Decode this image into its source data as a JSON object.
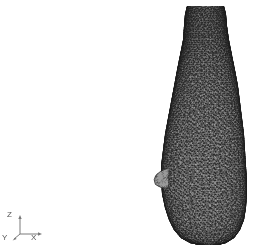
{
  "figure": {
    "background_color": "#ffffff",
    "mesh_color": "#3a3a3a",
    "mesh_fill_color": "#b9b9b9",
    "width": 259,
    "height": 251
  },
  "axis_triad": {
    "name": "coordinate-axis-triad",
    "origin_px": [
      20,
      234
    ],
    "line_color": "#7a7a7a",
    "label_color": "#555555",
    "axes": [
      {
        "id": "z",
        "label": "Z",
        "direction": "up",
        "end_px": [
          20,
          212
        ]
      },
      {
        "id": "x",
        "label": "X",
        "direction": "right",
        "end_px": [
          42,
          234
        ]
      },
      {
        "id": "y",
        "label": "Y",
        "direction": "out-of-screen",
        "end_px": [
          14,
          239
        ]
      }
    ]
  },
  "mesh_object": {
    "name": "bottle-mesh",
    "shape": "bottle",
    "element_type": "triangle",
    "rendering": "wireframe-surface",
    "bounds_px": {
      "left": 160,
      "top": 6,
      "right": 248,
      "bottom": 245
    },
    "profile": [
      {
        "y": 6,
        "left": 187,
        "right": 224
      },
      {
        "y": 14,
        "left": 185,
        "right": 226
      },
      {
        "y": 26,
        "left": 184,
        "right": 227
      },
      {
        "y": 40,
        "left": 183,
        "right": 229
      },
      {
        "y": 55,
        "left": 180,
        "right": 232
      },
      {
        "y": 70,
        "left": 177,
        "right": 235
      },
      {
        "y": 86,
        "left": 174,
        "right": 238
      },
      {
        "y": 102,
        "left": 171,
        "right": 240
      },
      {
        "y": 118,
        "left": 168,
        "right": 242
      },
      {
        "y": 134,
        "left": 165,
        "right": 244
      },
      {
        "y": 150,
        "left": 163,
        "right": 245
      },
      {
        "y": 166,
        "left": 161,
        "right": 246
      },
      {
        "y": 180,
        "left": 161,
        "right": 247
      },
      {
        "y": 194,
        "left": 162,
        "right": 247
      },
      {
        "y": 208,
        "left": 165,
        "right": 246
      },
      {
        "y": 220,
        "left": 169,
        "right": 244
      },
      {
        "y": 230,
        "left": 174,
        "right": 240
      },
      {
        "y": 238,
        "left": 181,
        "right": 234
      },
      {
        "y": 243,
        "left": 190,
        "right": 226
      },
      {
        "y": 245,
        "left": 199,
        "right": 218
      }
    ],
    "nub": {
      "name": "side-protrusion",
      "center_px": [
        162,
        178
      ],
      "width": 12,
      "height": 20
    }
  }
}
